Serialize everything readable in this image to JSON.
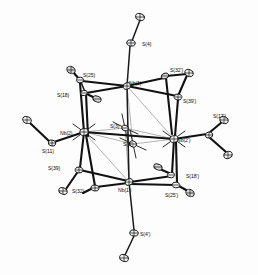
{
  "figure": {
    "kind": "ortep-thermal-ellipsoid-plot",
    "compound": "Nb4S4 cluster with sulfur ligands",
    "background_color": "#fdfdfd",
    "line_color": "#111111",
    "ellipsoid_fill": "#f2f2f2",
    "width": 258,
    "height": 275
  },
  "labels": [
    {
      "id": "s4",
      "text": "S(4)",
      "x": 142,
      "y": 41,
      "anchor": "left"
    },
    {
      "id": "s25",
      "text": "S(25)",
      "x": 83,
      "y": 72,
      "anchor": "left"
    },
    {
      "id": "s32p",
      "text": "S(32')",
      "x": 170,
      "y": 67,
      "anchor": "left"
    },
    {
      "id": "nb1",
      "text": "Nb(1)",
      "x": 129,
      "y": 80,
      "anchor": "left"
    },
    {
      "id": "s18",
      "text": "S(18)",
      "x": 57,
      "y": 92,
      "anchor": "left"
    },
    {
      "id": "s39p",
      "text": "S(39')",
      "x": 183,
      "y": 98,
      "anchor": "left"
    },
    {
      "id": "s17p",
      "text": "S(17')",
      "x": 213,
      "y": 113,
      "anchor": "left"
    },
    {
      "id": "s3",
      "text": "S(3)",
      "x": 110,
      "y": 123,
      "anchor": "left"
    },
    {
      "id": "nb2",
      "text": "Nb(2)",
      "x": 60,
      "y": 130,
      "anchor": "left"
    },
    {
      "id": "nb2p",
      "text": "Nb(2')",
      "x": 177,
      "y": 137,
      "anchor": "left"
    },
    {
      "id": "s3p",
      "text": "S(3')",
      "x": 123,
      "y": 141,
      "anchor": "left"
    },
    {
      "id": "s11",
      "text": "S(11)",
      "x": 42,
      "y": 148,
      "anchor": "left"
    },
    {
      "id": "s39",
      "text": "S(39)",
      "x": 48,
      "y": 165,
      "anchor": "left"
    },
    {
      "id": "s18p",
      "text": "S(18')",
      "x": 186,
      "y": 173,
      "anchor": "left"
    },
    {
      "id": "nb1p",
      "text": "Nb(1')",
      "x": 118,
      "y": 187,
      "anchor": "left"
    },
    {
      "id": "s32",
      "text": "S(32)",
      "x": 72,
      "y": 188,
      "anchor": "left"
    },
    {
      "id": "s25p",
      "text": "S(25')",
      "x": 165,
      "y": 192,
      "anchor": "left"
    },
    {
      "id": "s4p",
      "text": "S(4')",
      "x": 140,
      "y": 231,
      "anchor": "left"
    }
  ],
  "atoms": {
    "core": [
      {
        "id": "nb1",
        "cx": 127,
        "cy": 86,
        "rx": 4.0,
        "ry": 3.2,
        "rot": -18,
        "shade": "light"
      },
      {
        "id": "nb2",
        "cx": 84,
        "cy": 132,
        "rx": 4.2,
        "ry": 3.4,
        "rot": -10,
        "shade": "light"
      },
      {
        "id": "nb2p",
        "cx": 174,
        "cy": 139,
        "rx": 4.2,
        "ry": 3.4,
        "rot": -10,
        "shade": "light"
      },
      {
        "id": "nb1p",
        "cx": 129,
        "cy": 182,
        "rx": 4.0,
        "ry": 3.2,
        "rot": -18,
        "shade": "light"
      },
      {
        "id": "s3",
        "cx": 125,
        "cy": 128,
        "rx": 3.4,
        "ry": 2.8,
        "rot": 20,
        "shade": "light"
      },
      {
        "id": "s3p",
        "cx": 133,
        "cy": 144,
        "rx": 3.6,
        "ry": 3.0,
        "rot": 20,
        "shade": "light"
      }
    ],
    "axial": [
      {
        "id": "s4",
        "cx": 131,
        "cy": 43,
        "rx": 4.3,
        "ry": 3.1,
        "rot": 12,
        "shade": "light"
      },
      {
        "id": "s4t",
        "cx": 140,
        "cy": 17,
        "rx": 4.6,
        "ry": 3.4,
        "rot": 18,
        "shade": "light"
      },
      {
        "id": "s4p",
        "cx": 134,
        "cy": 233,
        "rx": 4.3,
        "ry": 3.1,
        "rot": 12,
        "shade": "light"
      },
      {
        "id": "s4pt",
        "cx": 124,
        "cy": 258,
        "rx": 4.6,
        "ry": 3.4,
        "rot": 18,
        "shade": "light"
      }
    ],
    "ligands": [
      {
        "id": "s25",
        "cx": 80,
        "cy": 80,
        "rx": 3.6,
        "ry": 2.8,
        "rot": 10,
        "shade": "light"
      },
      {
        "id": "s25t",
        "cx": 71,
        "cy": 70,
        "rx": 4.4,
        "ry": 3.4,
        "rot": 30,
        "shade": "dark"
      },
      {
        "id": "s18",
        "cx": 84,
        "cy": 93,
        "rx": 3.4,
        "ry": 2.6,
        "rot": -10,
        "shade": "light"
      },
      {
        "id": "s18t",
        "cx": 97,
        "cy": 99,
        "rx": 4.3,
        "ry": 2.8,
        "rot": 25,
        "shade": "dark"
      },
      {
        "id": "s32p",
        "cx": 165,
        "cy": 76,
        "rx": 3.8,
        "ry": 2.8,
        "rot": -20,
        "shade": "dark"
      },
      {
        "id": "s32pt",
        "cx": 189,
        "cy": 73,
        "rx": 4.4,
        "ry": 3.4,
        "rot": 20,
        "shade": "light"
      },
      {
        "id": "s39p",
        "cx": 178,
        "cy": 97,
        "rx": 3.8,
        "ry": 3.0,
        "rot": 10,
        "shade": "light"
      },
      {
        "id": "s11",
        "cx": 52,
        "cy": 143,
        "rx": 3.8,
        "ry": 3.0,
        "rot": 15,
        "shade": "light"
      },
      {
        "id": "s11t",
        "cx": 27,
        "cy": 120,
        "rx": 4.5,
        "ry": 3.4,
        "rot": 25,
        "shade": "light"
      },
      {
        "id": "s17p",
        "cx": 209,
        "cy": 135,
        "rx": 3.8,
        "ry": 3.0,
        "rot": -15,
        "shade": "light"
      },
      {
        "id": "s17pt",
        "cx": 224,
        "cy": 120,
        "rx": 4.4,
        "ry": 3.4,
        "rot": 20,
        "shade": "light"
      },
      {
        "id": "s17pb",
        "cx": 228,
        "cy": 155,
        "rx": 4.4,
        "ry": 3.4,
        "rot": -20,
        "shade": "light"
      },
      {
        "id": "s39",
        "cx": 79,
        "cy": 170,
        "rx": 3.8,
        "ry": 3.0,
        "rot": 10,
        "shade": "light"
      },
      {
        "id": "s32",
        "cx": 95,
        "cy": 188,
        "rx": 4.0,
        "ry": 3.0,
        "rot": 10,
        "shade": "light"
      },
      {
        "id": "s32t",
        "cx": 63,
        "cy": 191,
        "rx": 4.4,
        "ry": 3.2,
        "rot": 20,
        "shade": "light"
      },
      {
        "id": "s18p",
        "cx": 171,
        "cy": 175,
        "rx": 3.6,
        "ry": 2.8,
        "rot": -10,
        "shade": "light"
      },
      {
        "id": "s18pt",
        "cx": 158,
        "cy": 167,
        "rx": 4.3,
        "ry": 2.8,
        "rot": 25,
        "shade": "dark"
      },
      {
        "id": "s25p",
        "cx": 176,
        "cy": 185,
        "rx": 3.8,
        "ry": 2.8,
        "rot": 10,
        "shade": "light"
      },
      {
        "id": "s25pt",
        "cx": 190,
        "cy": 193,
        "rx": 4.4,
        "ry": 3.4,
        "rot": 30,
        "shade": "dark"
      }
    ]
  }
}
